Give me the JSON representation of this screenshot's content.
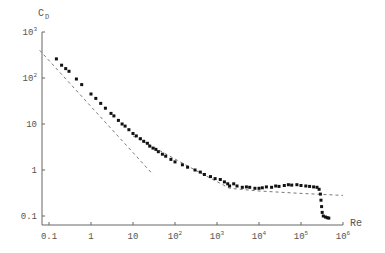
{
  "chart_data": {
    "type": "scatter",
    "title": "",
    "xlabel": "Re",
    "ylabel": "C_D",
    "xscale": "log",
    "yscale": "log",
    "xlim": [
      0.06,
      1000000
    ],
    "ylim": [
      0.06,
      1000
    ],
    "grid": false,
    "x_ticks": [
      {
        "value": 0.1,
        "label": "0.1",
        "base": "",
        "exp": ""
      },
      {
        "value": 1,
        "label": "1",
        "base": "",
        "exp": ""
      },
      {
        "value": 10,
        "label": "10",
        "base": "",
        "exp": ""
      },
      {
        "value": 100,
        "label": "",
        "base": "10",
        "exp": "2"
      },
      {
        "value": 1000,
        "label": "",
        "base": "10",
        "exp": "3"
      },
      {
        "value": 10000,
        "label": "",
        "base": "10",
        "exp": "4"
      },
      {
        "value": 100000,
        "label": "",
        "base": "10",
        "exp": "5"
      },
      {
        "value": 1000000,
        "label": "",
        "base": "10",
        "exp": "6"
      }
    ],
    "y_ticks": [
      {
        "value": 0.1,
        "label": "0.1",
        "base": "",
        "exp": ""
      },
      {
        "value": 1,
        "label": "1",
        "base": "",
        "exp": ""
      },
      {
        "value": 10,
        "label": "10",
        "base": "",
        "exp": ""
      },
      {
        "value": 100,
        "label": "",
        "base": "10",
        "exp": "2"
      },
      {
        "value": 1000,
        "label": "",
        "base": "10",
        "exp": "3"
      }
    ],
    "series": [
      {
        "name": "measured C_D",
        "style": "markers",
        "color": "#111111",
        "points": [
          [
            0.15,
            260
          ],
          [
            0.2,
            190
          ],
          [
            0.25,
            160
          ],
          [
            0.3,
            140
          ],
          [
            0.45,
            95
          ],
          [
            0.6,
            72
          ],
          [
            1.0,
            45
          ],
          [
            1.3,
            36
          ],
          [
            1.7,
            28
          ],
          [
            2.2,
            22
          ],
          [
            3.0,
            17
          ],
          [
            3.5,
            15
          ],
          [
            4.5,
            12
          ],
          [
            5.5,
            10
          ],
          [
            6.5,
            9.0
          ],
          [
            8,
            7.5
          ],
          [
            10,
            6.2
          ],
          [
            12,
            5.5
          ],
          [
            15,
            4.8
          ],
          [
            18,
            4.2
          ],
          [
            22,
            3.8
          ],
          [
            25,
            3.3
          ],
          [
            30,
            3.0
          ],
          [
            35,
            2.8
          ],
          [
            40,
            2.5
          ],
          [
            50,
            2.2
          ],
          [
            60,
            2.0
          ],
          [
            80,
            1.7
          ],
          [
            100,
            1.5
          ],
          [
            150,
            1.3
          ],
          [
            200,
            1.15
          ],
          [
            300,
            1.0
          ],
          [
            400,
            0.9
          ],
          [
            500,
            0.8
          ],
          [
            700,
            0.72
          ],
          [
            900,
            0.65
          ],
          [
            1200,
            0.62
          ],
          [
            1500,
            0.55
          ],
          [
            1800,
            0.5
          ],
          [
            2000,
            0.45
          ],
          [
            2500,
            0.5
          ],
          [
            3000,
            0.45
          ],
          [
            4000,
            0.42
          ],
          [
            5000,
            0.43
          ],
          [
            6000,
            0.42
          ],
          [
            8000,
            0.4
          ],
          [
            10000,
            0.4
          ],
          [
            12000,
            0.41
          ],
          [
            15000,
            0.43
          ],
          [
            20000,
            0.42
          ],
          [
            25000,
            0.45
          ],
          [
            30000,
            0.44
          ],
          [
            40000,
            0.46
          ],
          [
            50000,
            0.48
          ],
          [
            60000,
            0.47
          ],
          [
            80000,
            0.48
          ],
          [
            100000,
            0.46
          ],
          [
            130000,
            0.45
          ],
          [
            160000,
            0.44
          ],
          [
            200000,
            0.43
          ],
          [
            240000,
            0.42
          ],
          [
            270000,
            0.38
          ],
          [
            290000,
            0.3
          ],
          [
            300000,
            0.22
          ],
          [
            310000,
            0.16
          ],
          [
            320000,
            0.12
          ],
          [
            340000,
            0.1
          ],
          [
            380000,
            0.095
          ],
          [
            420000,
            0.092
          ],
          [
            460000,
            0.09
          ]
        ]
      },
      {
        "name": "Stokes law 24/Re",
        "style": "dashed",
        "color": "#555555",
        "points": [
          [
            0.06,
            400
          ],
          [
            30,
            0.8
          ]
        ]
      },
      {
        "name": "Newton regime asymptote",
        "style": "dashed",
        "color": "#555555",
        "points": [
          [
            10,
            5.5
          ],
          [
            300,
            1.0
          ],
          [
            2000,
            0.4
          ],
          [
            10000,
            0.35
          ],
          [
            100000,
            0.31
          ],
          [
            1000000,
            0.28
          ]
        ]
      }
    ]
  },
  "layout": {
    "axis_color": "#666666",
    "plot_left": 42,
    "plot_bottom": 225,
    "x_px_per_decade": 42,
    "y_px_per_decade": 46,
    "x_origin_px": 49,
    "y_origin_px": 170
  }
}
